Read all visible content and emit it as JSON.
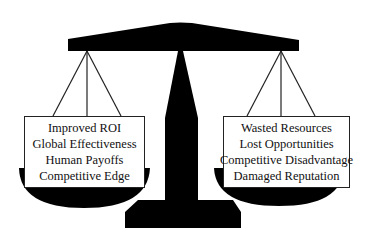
{
  "diagram": {
    "type": "balance-scale",
    "colors": {
      "scale_fill": "#000000",
      "box_fill": "#ffffff",
      "box_border": "#222222",
      "text": "#111111",
      "background": "#ffffff"
    },
    "left_pan": {
      "items": [
        "Improved ROI",
        "Global Effectiveness",
        "Human Payoffs",
        "Competitive Edge"
      ]
    },
    "right_pan": {
      "items": [
        "Wasted Resources",
        "Lost Opportunities",
        "Competitive Disadvantage",
        "Damaged Reputation"
      ]
    }
  }
}
